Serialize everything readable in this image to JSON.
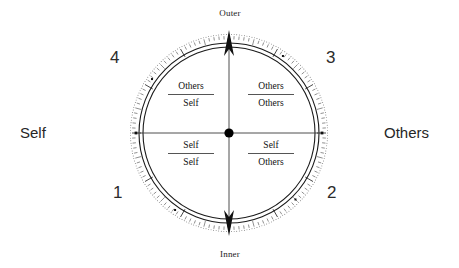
{
  "diagram": {
    "type": "quadrant-compass-circle",
    "axes": {
      "vertical": {
        "top_label": "Outer",
        "bottom_label": "Inner",
        "arrow_top": true,
        "arrow_bottom": true
      },
      "horizontal": {
        "left_label": "Self",
        "right_label": "Others",
        "arrow_left": false,
        "arrow_right": false
      }
    },
    "quadrants": [
      {
        "number": "4",
        "position": "top-left",
        "numerator": "Others",
        "denominator": "Self"
      },
      {
        "number": "3",
        "position": "top-right",
        "numerator": "Others",
        "denominator": "Others"
      },
      {
        "number": "1",
        "position": "bottom-left",
        "numerator": "Self",
        "denominator": "Self"
      },
      {
        "number": "2",
        "position": "bottom-right",
        "numerator": "Self",
        "denominator": "Others"
      }
    ],
    "colors": {
      "line": "#1a1a1a",
      "text": "#1a1a1a",
      "side_text": "#262626",
      "fraction_bar": "#555555",
      "tick": "#333333",
      "background": "#ffffff"
    },
    "geometry": {
      "center_x": 229,
      "center_y": 133,
      "tick_ring_radius": 99,
      "outer_circle_radius": 90,
      "inner_circle_radius": 86,
      "hub_radius": 5
    }
  }
}
